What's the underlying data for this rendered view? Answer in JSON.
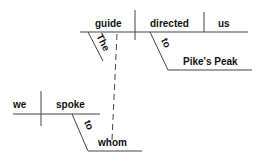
{
  "diagram": {
    "type": "sentence-diagram",
    "main_clause": {
      "subject": "guide",
      "subject_modifier": "The",
      "verb": "directed",
      "object": "us",
      "preposition": "to",
      "prepositional_object": "Pike's Peak"
    },
    "relative_clause": {
      "subject": "we",
      "verb": "spoke",
      "preposition": "to",
      "prepositional_object": "whom"
    },
    "colors": {
      "line": "#444444",
      "text": "#111111"
    }
  }
}
